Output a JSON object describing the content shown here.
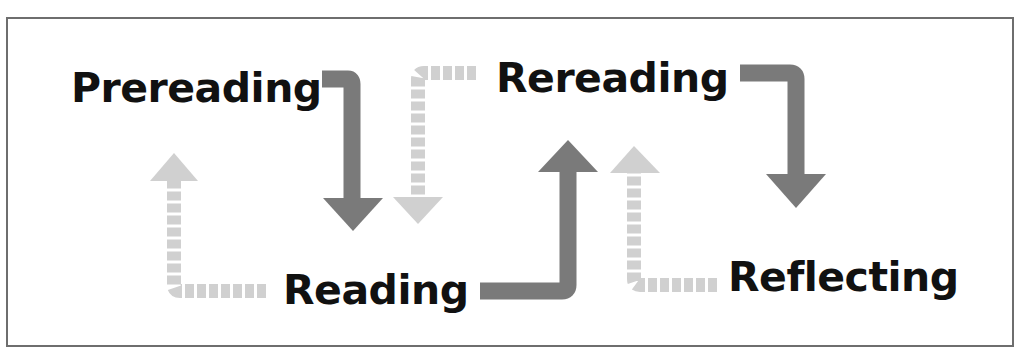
{
  "diagram": {
    "type": "cycle",
    "stages": [
      {
        "id": "prereading",
        "label": "Prereading"
      },
      {
        "id": "reading",
        "label": "Reading"
      },
      {
        "id": "rereading",
        "label": "Rereading"
      },
      {
        "id": "reflecting",
        "label": "Reflecting"
      }
    ],
    "forward_edges": [
      {
        "from": "prereading",
        "to": "reading",
        "style": "solid"
      },
      {
        "from": "reading",
        "to": "rereading",
        "style": "solid"
      },
      {
        "from": "rereading",
        "to": "reflecting",
        "style": "solid"
      }
    ],
    "backward_edges": [
      {
        "from": "reading",
        "to": "prereading",
        "style": "dashed"
      },
      {
        "from": "rereading",
        "to": "reading",
        "style": "dashed"
      },
      {
        "from": "reflecting",
        "to": "rereading",
        "style": "dashed"
      }
    ],
    "colors": {
      "solid_arrow": "#7a7a7a",
      "dashed_arrow": "#d0d0d0",
      "text": "#111111",
      "border": "#6e6e6e",
      "background": "#ffffff"
    }
  }
}
